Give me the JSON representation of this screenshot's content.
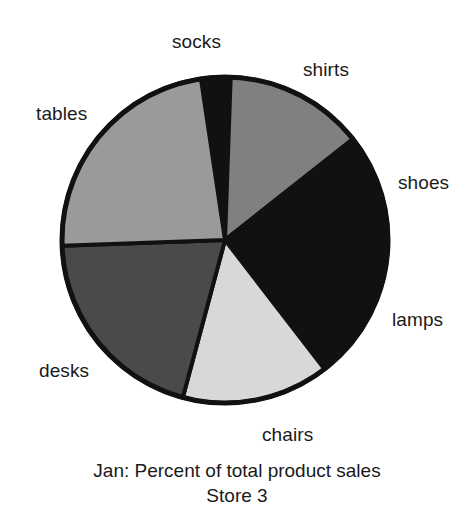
{
  "chart_data": {
    "type": "pie",
    "title": "Jan: Percent of total product sales",
    "subtitle": "Store 3",
    "xlabel": "",
    "ylabel": "",
    "legend_position": "none",
    "grid": false,
    "labels_outside": true,
    "categories": [
      "socks",
      "shirts",
      "shoes",
      "lamps",
      "chairs",
      "desks",
      "tables"
    ],
    "values": [
      3,
      14,
      13,
      12,
      15,
      20,
      23
    ],
    "slices": [
      {
        "label": "socks",
        "value": 3,
        "start_angle_deg": 88.0,
        "end_angle_deg": 98.5,
        "color": "#111111"
      },
      {
        "label": "shirts",
        "value": 14,
        "start_angle_deg": 38.3,
        "end_angle_deg": 88.0,
        "color": "#808080"
      },
      {
        "label": "shoes",
        "value": 13,
        "start_angle_deg": 0.0,
        "end_angle_deg": 38.3,
        "color": "#111111"
      },
      {
        "label": "lamps",
        "value": 12,
        "start_angle_deg": -52.4,
        "end_angle_deg": 0.0,
        "color": "#111111"
      },
      {
        "label": "chairs",
        "value": 15,
        "start_angle_deg": -105.0,
        "end_angle_deg": -52.4,
        "color": "#d8d8d8"
      },
      {
        "label": "desks",
        "value": 20,
        "start_angle_deg": -178.0,
        "end_angle_deg": -105.0,
        "color": "#4a4a4a"
      },
      {
        "label": "tables",
        "value": 23,
        "start_angle_deg": 98.5,
        "end_angle_deg": 182.0,
        "color": "#9a9a9a"
      }
    ],
    "center": {
      "x": 225,
      "y": 240
    },
    "radius": 163,
    "outline_color": "#111111",
    "background_color": "#ffffff"
  },
  "labels": {
    "socks": {
      "text": "socks",
      "left": 172,
      "top": 32
    },
    "shirts": {
      "text": "shirts",
      "left": 303,
      "top": 60
    },
    "shoes": {
      "text": "shoes",
      "left": 398,
      "top": 173
    },
    "lamps": {
      "text": "lamps",
      "left": 392,
      "top": 310
    },
    "chairs": {
      "text": "chairs",
      "left": 262,
      "top": 425
    },
    "desks": {
      "text": "desks",
      "left": 39,
      "top": 361
    },
    "tables": {
      "text": "tables",
      "left": 36,
      "top": 104
    }
  },
  "caption": {
    "line1": "Jan: Percent of total product sales",
    "line2": "Store 3"
  }
}
